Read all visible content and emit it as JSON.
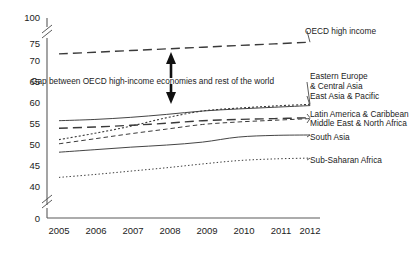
{
  "chart_data": {
    "type": "line",
    "title": "",
    "subtitle": "",
    "xlabel": "",
    "ylabel": "",
    "x": [
      2005,
      2006,
      2007,
      2008,
      2009,
      2010,
      2011,
      2012
    ],
    "xtick_labels": [
      "2005",
      "2006",
      "2007",
      "2008",
      "2009",
      "2010",
      "2011",
      "2012"
    ],
    "ytick_labels": [
      "0",
      "40",
      "45",
      "50",
      "55",
      "60",
      "65",
      "70",
      "75",
      "100"
    ],
    "ytick_values": [
      0,
      40,
      45,
      50,
      55,
      60,
      65,
      70,
      75,
      100
    ],
    "ylim": [
      40,
      77
    ],
    "axis_breaks": [
      {
        "between": [
          0,
          40
        ]
      },
      {
        "between": [
          75,
          100
        ]
      }
    ],
    "grid": false,
    "legend_position": "right-inline",
    "series": [
      {
        "name": "OECD high income",
        "style": "long-dash",
        "label": "OECD high income",
        "values": [
          72.4,
          72.8,
          73.2,
          73.6,
          74.0,
          74.4,
          74.8,
          75.2
        ]
      },
      {
        "name": "Eastern Europe & Central Asia",
        "style": "dotted",
        "label": "Eastern Europe\n& Central Asia",
        "values": [
          52.0,
          53.5,
          55.2,
          57.2,
          58.8,
          59.5,
          60.0,
          60.4
        ]
      },
      {
        "name": "East Asia & Pacific",
        "style": "solid",
        "label": "East Asia & Pacific",
        "values": [
          56.5,
          56.8,
          57.3,
          58.0,
          58.8,
          59.3,
          59.7,
          60.1
        ]
      },
      {
        "name": "Latin America & Caribbean",
        "style": "long-dash",
        "label": "Latin America & Caribbean",
        "values": [
          54.7,
          55.0,
          55.4,
          55.9,
          56.5,
          56.8,
          57.0,
          57.2
        ]
      },
      {
        "name": "Middle East & North Africa",
        "style": "short-dash",
        "label": "Middle East & North Africa",
        "values": [
          51.0,
          52.2,
          53.4,
          54.5,
          55.6,
          56.2,
          56.6,
          57.0
        ]
      },
      {
        "name": "South Asia",
        "style": "solid",
        "label": "South Asia",
        "values": [
          49.0,
          49.6,
          50.2,
          50.7,
          51.4,
          52.6,
          53.0,
          53.1
        ]
      },
      {
        "name": "Sub-Saharan Africa",
        "style": "fine-dotted",
        "label": "Sub-Saharan Africa",
        "values": [
          43.0,
          43.7,
          44.5,
          45.3,
          46.2,
          47.0,
          47.4,
          47.6
        ]
      }
    ],
    "annotations": [
      {
        "name": "gap-annotation",
        "text": "Gap between OECD high-income economies and rest of the world",
        "arrow": "double-vertical"
      }
    ]
  },
  "labels": {
    "oecd_high_income": "OECD high income",
    "eastern_europe_line1": "Eastern Europe",
    "eastern_europe_line2": "& Central Asia",
    "east_asia_pacific": "East Asia & Pacific",
    "latin_america": "Latin America & Caribbean",
    "middle_east": "Middle East & North Africa",
    "south_asia": "South Asia",
    "sub_saharan": "Sub-Saharan Africa",
    "gap_text": "Gap between OECD high-income economies and rest of the world"
  },
  "ticks": {
    "y": [
      "100",
      "75",
      "70",
      "65",
      "60",
      "55",
      "50",
      "45",
      "40",
      "0"
    ],
    "x": [
      "2005",
      "2006",
      "2007",
      "2008",
      "2009",
      "2010",
      "2011",
      "2012"
    ]
  },
  "colors": {
    "line": "#3a3a3a",
    "axis": "#5a5a5a",
    "text": "#1c1c1c",
    "background": "#ffffff"
  }
}
